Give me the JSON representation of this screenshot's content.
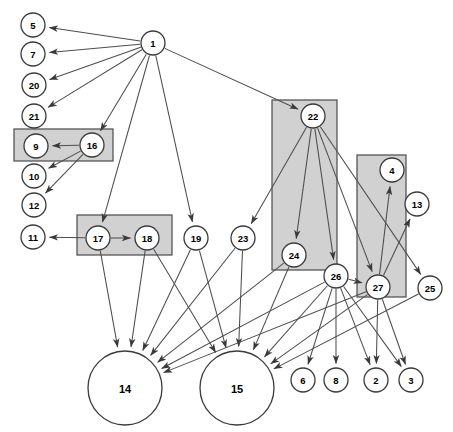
{
  "diagram": {
    "canvas": {
      "width": 453,
      "height": 432
    },
    "colors": {
      "background": "#ffffff",
      "node_fill": "#ffffff",
      "node_stroke": "#3a3a3a",
      "edge_stroke": "#4d4d4d",
      "group_fill": "#c9c9c9",
      "group_stroke": "#4a4a4a"
    },
    "nodes": [
      {
        "id": "5",
        "label": "5",
        "cx": 33,
        "cy": 25,
        "r": 12,
        "size": "small"
      },
      {
        "id": "7",
        "label": "7",
        "cx": 33,
        "cy": 54,
        "r": 12,
        "size": "small"
      },
      {
        "id": "20",
        "label": "20",
        "cx": 34,
        "cy": 85,
        "r": 12,
        "size": "small"
      },
      {
        "id": "21",
        "label": "21",
        "cx": 34,
        "cy": 116,
        "r": 12,
        "size": "small"
      },
      {
        "id": "9",
        "label": "9",
        "cx": 36,
        "cy": 146,
        "r": 12,
        "size": "small"
      },
      {
        "id": "16",
        "label": "16",
        "cx": 92,
        "cy": 145,
        "r": 12,
        "size": "small"
      },
      {
        "id": "10",
        "label": "10",
        "cx": 34,
        "cy": 176,
        "r": 12,
        "size": "small"
      },
      {
        "id": "12",
        "label": "12",
        "cx": 34,
        "cy": 205,
        "r": 12,
        "size": "small"
      },
      {
        "id": "1",
        "label": "1",
        "cx": 153,
        "cy": 43,
        "r": 12,
        "size": "small"
      },
      {
        "id": "11",
        "label": "11",
        "cx": 33,
        "cy": 237,
        "r": 12,
        "size": "small"
      },
      {
        "id": "17",
        "label": "17",
        "cx": 98,
        "cy": 238,
        "r": 12,
        "size": "small"
      },
      {
        "id": "18",
        "label": "18",
        "cx": 147,
        "cy": 238,
        "r": 12,
        "size": "small"
      },
      {
        "id": "19",
        "label": "19",
        "cx": 196,
        "cy": 238,
        "r": 12,
        "size": "small"
      },
      {
        "id": "23",
        "label": "23",
        "cx": 243,
        "cy": 238,
        "r": 12,
        "size": "small"
      },
      {
        "id": "22",
        "label": "22",
        "cx": 313,
        "cy": 116,
        "r": 12,
        "size": "small"
      },
      {
        "id": "24",
        "label": "24",
        "cx": 294,
        "cy": 255,
        "r": 12,
        "size": "small"
      },
      {
        "id": "4",
        "label": "4",
        "cx": 392,
        "cy": 170,
        "r": 12,
        "size": "small"
      },
      {
        "id": "13",
        "label": "13",
        "cx": 417,
        "cy": 204,
        "r": 12,
        "size": "small"
      },
      {
        "id": "26",
        "label": "26",
        "cx": 336,
        "cy": 276,
        "r": 12,
        "size": "small"
      },
      {
        "id": "27",
        "label": "27",
        "cx": 378,
        "cy": 287,
        "r": 12,
        "size": "small"
      },
      {
        "id": "25",
        "label": "25",
        "cx": 430,
        "cy": 288,
        "r": 12,
        "size": "small"
      },
      {
        "id": "14",
        "label": "14",
        "cx": 125,
        "cy": 388,
        "r": 37,
        "size": "large"
      },
      {
        "id": "15",
        "label": "15",
        "cx": 237,
        "cy": 388,
        "r": 37,
        "size": "large"
      },
      {
        "id": "6",
        "label": "6",
        "cx": 303,
        "cy": 380,
        "r": 12,
        "size": "small"
      },
      {
        "id": "8",
        "label": "8",
        "cx": 336,
        "cy": 380,
        "r": 12,
        "size": "small"
      },
      {
        "id": "2",
        "label": "2",
        "cx": 376,
        "cy": 380,
        "r": 12,
        "size": "small"
      },
      {
        "id": "3",
        "label": "3",
        "cx": 411,
        "cy": 380,
        "r": 12,
        "size": "small"
      }
    ],
    "groups": [
      {
        "id": "group-9-16",
        "x": 14,
        "y": 129,
        "width": 99,
        "height": 32,
        "members": [
          "9",
          "16"
        ]
      },
      {
        "id": "group-17-18",
        "x": 77,
        "y": 215,
        "width": 95,
        "height": 40,
        "members": [
          "17",
          "18"
        ]
      },
      {
        "id": "group-22-24",
        "x": 272,
        "y": 100,
        "width": 65,
        "height": 170,
        "members": [
          "22",
          "24"
        ]
      },
      {
        "id": "group-4-27",
        "x": 357,
        "y": 155,
        "width": 49,
        "height": 142,
        "members": [
          "4",
          "27"
        ]
      }
    ],
    "edges": [
      {
        "from": "1",
        "to": "5"
      },
      {
        "from": "1",
        "to": "7"
      },
      {
        "from": "1",
        "to": "20"
      },
      {
        "from": "1",
        "to": "21"
      },
      {
        "from": "1",
        "to": "16"
      },
      {
        "from": "1",
        "to": "17"
      },
      {
        "from": "1",
        "to": "19"
      },
      {
        "from": "1",
        "to": "22"
      },
      {
        "from": "16",
        "to": "9"
      },
      {
        "from": "16",
        "to": "10"
      },
      {
        "from": "16",
        "to": "12"
      },
      {
        "from": "17",
        "to": "11"
      },
      {
        "from": "17",
        "to": "18"
      },
      {
        "from": "17",
        "to": "14"
      },
      {
        "from": "18",
        "to": "14"
      },
      {
        "from": "18",
        "to": "15"
      },
      {
        "from": "19",
        "to": "14"
      },
      {
        "from": "19",
        "to": "15"
      },
      {
        "from": "23",
        "to": "14"
      },
      {
        "from": "23",
        "to": "15"
      },
      {
        "from": "22",
        "to": "23"
      },
      {
        "from": "22",
        "to": "24"
      },
      {
        "from": "22",
        "to": "26"
      },
      {
        "from": "22",
        "to": "27"
      },
      {
        "from": "22",
        "to": "25"
      },
      {
        "from": "24",
        "to": "14"
      },
      {
        "from": "24",
        "to": "15"
      },
      {
        "from": "26",
        "to": "14"
      },
      {
        "from": "26",
        "to": "15"
      },
      {
        "from": "26",
        "to": "6"
      },
      {
        "from": "26",
        "to": "8"
      },
      {
        "from": "26",
        "to": "2"
      },
      {
        "from": "26",
        "to": "3"
      },
      {
        "from": "26",
        "to": "27"
      },
      {
        "from": "27",
        "to": "4"
      },
      {
        "from": "27",
        "to": "13"
      },
      {
        "from": "27",
        "to": "2"
      },
      {
        "from": "27",
        "to": "3"
      },
      {
        "from": "27",
        "to": "14"
      },
      {
        "from": "27",
        "to": "15"
      },
      {
        "from": "25",
        "to": "15"
      }
    ]
  }
}
